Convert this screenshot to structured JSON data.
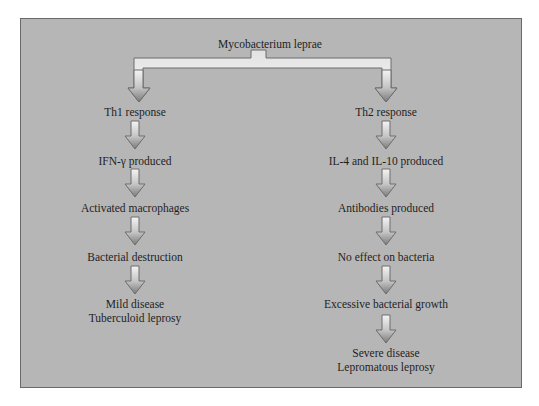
{
  "diagram": {
    "type": "flowchart",
    "root": {
      "label": "Mycobacterium leprae"
    },
    "colors": {
      "panel_background": "#b6b6b6",
      "panel_border": "#6a6a6a",
      "arrow_light": "#f2f2f2",
      "arrow_dark": "#7e7e7e",
      "arrow_outline": "#6c6c6c",
      "text": "#1e1e1e"
    },
    "left_branch": {
      "nodes": [
        {
          "label": "Th1 response"
        },
        {
          "label": "IFN-γ produced"
        },
        {
          "label": "Activated macrophages"
        },
        {
          "label": "Bacterial destruction"
        },
        {
          "label_line1": "Mild disease",
          "label_line2": "Tuberculoid leprosy"
        }
      ]
    },
    "right_branch": {
      "nodes": [
        {
          "label": "Th2 response"
        },
        {
          "label": "IL-4 and IL-10 produced"
        },
        {
          "label": "Antibodies produced"
        },
        {
          "label": "No effect on bacteria"
        },
        {
          "label": "Excessive bacterial growth"
        },
        {
          "label_line1": "Severe disease",
          "label_line2": "Lepromatous leprosy"
        }
      ]
    },
    "edges": [
      {
        "from": "Mycobacterium leprae",
        "to": "Th1 response"
      },
      {
        "from": "Mycobacterium leprae",
        "to": "Th2 response"
      },
      {
        "from": "Th1 response",
        "to": "IFN-γ produced"
      },
      {
        "from": "IFN-γ produced",
        "to": "Activated macrophages"
      },
      {
        "from": "Activated macrophages",
        "to": "Bacterial destruction"
      },
      {
        "from": "Bacterial destruction",
        "to": "Mild disease / Tuberculoid leprosy"
      },
      {
        "from": "Th2 response",
        "to": "IL-4 and IL-10 produced"
      },
      {
        "from": "IL-4 and IL-10 produced",
        "to": "Antibodies produced"
      },
      {
        "from": "Antibodies produced",
        "to": "No effect on bacteria"
      },
      {
        "from": "No effect on bacteria",
        "to": "Excessive bacterial growth"
      },
      {
        "from": "Excessive bacterial growth",
        "to": "Severe disease / Lepromatous leprosy"
      }
    ]
  }
}
